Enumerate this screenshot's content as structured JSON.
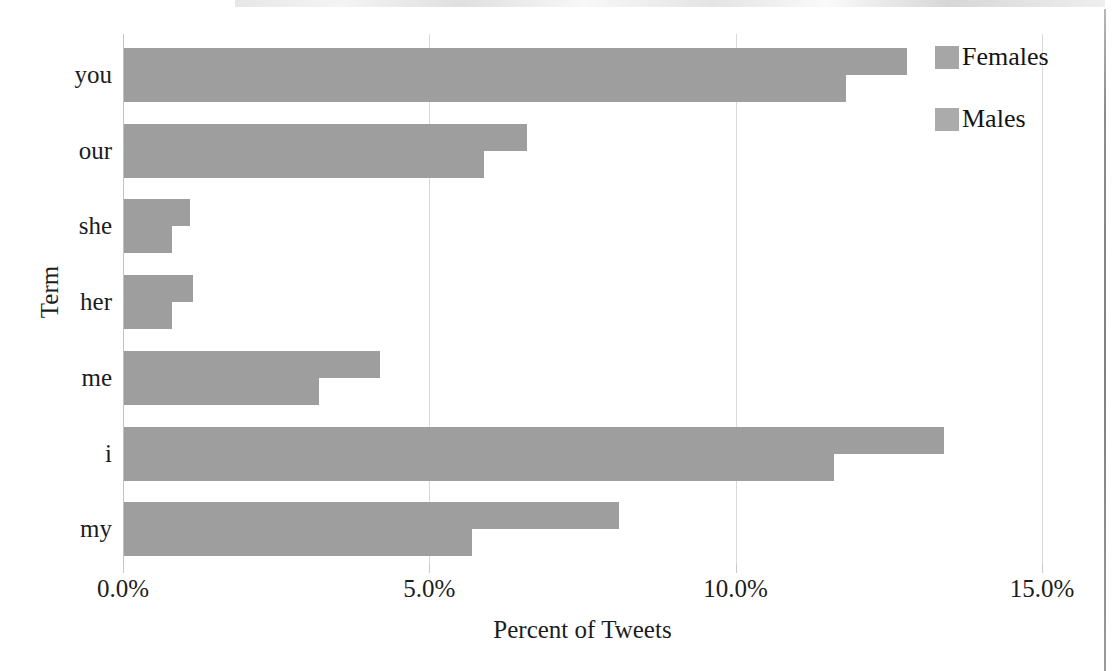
{
  "chart_data": {
    "type": "bar",
    "orientation": "horizontal",
    "title": "",
    "xlabel": "Percent of Tweets",
    "ylabel": "Term",
    "categories": [
      "you",
      "our",
      "she",
      "her",
      "me",
      "i",
      "my"
    ],
    "series": [
      {
        "name": "Females",
        "values": [
          12.8,
          6.6,
          1.1,
          1.15,
          4.2,
          13.4,
          8.1
        ]
      },
      {
        "name": "Males",
        "values": [
          11.8,
          5.9,
          0.8,
          0.8,
          3.2,
          11.6,
          5.7
        ]
      }
    ],
    "xlim": [
      0,
      15
    ],
    "xticks": [
      0,
      5,
      10,
      15
    ],
    "xtick_labels": [
      "0.0%",
      "5.0%",
      "10.0%",
      "15.0%"
    ],
    "grid": true,
    "legend_position": "right",
    "value_format": "percent",
    "colors": {
      "females": "#9e9e9e",
      "males": "#9e9e9e",
      "gridline": "#d9d9d9",
      "text": "#1c1c1c",
      "background": "#ffffff"
    }
  },
  "axes": {
    "y_title": "Term",
    "x_title": "Percent of Tweets"
  },
  "legend": {
    "items": [
      {
        "label": "Females",
        "swatch": "legend-swatch-females"
      },
      {
        "label": "Males",
        "swatch": "legend-swatch-males"
      }
    ]
  }
}
